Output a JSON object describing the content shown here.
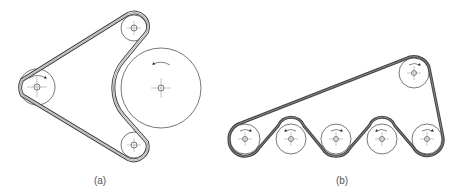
{
  "figure": {
    "labels": {
      "a": "(a)",
      "b": "(b)"
    },
    "colors": {
      "belt": "#444444",
      "pulley": "#555555",
      "centerline": "#888888",
      "background": "#ffffff"
    }
  },
  "diagram_a": {
    "description": "Serpentine belt around driver pulley, two idlers, wrapping back side of large pulley",
    "pulleys": [
      {
        "name": "driver-left",
        "cx": 37,
        "cy": 87,
        "r": 18,
        "rotation": "clockwise"
      },
      {
        "name": "idler-top",
        "cx": 134,
        "cy": 28,
        "r": 13
      },
      {
        "name": "idler-bottom",
        "cx": 134,
        "cy": 145,
        "r": 13
      },
      {
        "name": "large-driven",
        "cx": 161,
        "cy": 88,
        "r": 40,
        "rotation": "counterclockwise"
      }
    ]
  },
  "diagram_b": {
    "description": "Belt wrapping alternately over and under five pulleys in a row, returning over a top pulley",
    "pulleys": [
      {
        "name": "pulley-1",
        "cx": 245,
        "cy": 139,
        "r": 15,
        "rotation": "clockwise"
      },
      {
        "name": "pulley-2",
        "cx": 291,
        "cy": 139,
        "r": 15,
        "rotation": "counterclockwise"
      },
      {
        "name": "pulley-3",
        "cx": 336,
        "cy": 139,
        "r": 15,
        "rotation": "clockwise"
      },
      {
        "name": "pulley-4",
        "cx": 382,
        "cy": 139,
        "r": 15,
        "rotation": "counterclockwise"
      },
      {
        "name": "pulley-5",
        "cx": 427,
        "cy": 139,
        "r": 15,
        "rotation": "clockwise"
      },
      {
        "name": "pulley-top",
        "cx": 414,
        "cy": 73,
        "r": 15,
        "rotation": "clockwise"
      }
    ]
  }
}
